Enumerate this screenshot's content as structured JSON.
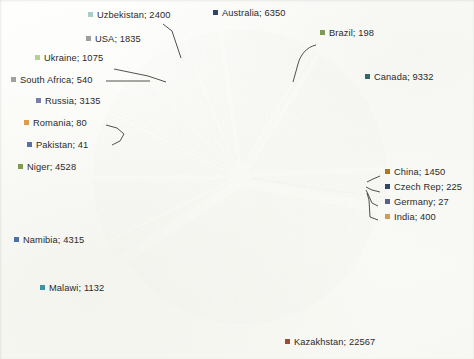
{
  "chart_data": {
    "type": "pie",
    "title": "",
    "subtitle": "",
    "xlabel": "",
    "ylabel": "",
    "legend_position": "callout-labels",
    "label_format": "name; value",
    "exploded": true,
    "grid": false,
    "total": 59655,
    "categories": [
      "Australia",
      "Brazil",
      "Canada",
      "China",
      "Czech Rep",
      "Germany",
      "India",
      "Kazakhstan",
      "Malawi",
      "Namibia",
      "Niger",
      "Pakistan",
      "Romania",
      "Russia",
      "South Africa",
      "Ukraine",
      "USA",
      "Uzbekistan"
    ],
    "values": [
      6350,
      198,
      9332,
      1450,
      225,
      27,
      400,
      22567,
      1132,
      4315,
      4528,
      41,
      80,
      3135,
      540,
      1075,
      1835,
      2400
    ],
    "colors": [
      "#2E4769",
      "#7F9B4E",
      "#33686B",
      "#A97B1E",
      "#2E4769",
      "#5B5F8C",
      "#D39B4B",
      "#9C4C37",
      "#3E93A3",
      "#4F6FA8",
      "#7F9B4E",
      "#5B6FA8",
      "#E09A4E",
      "#7B7FA8",
      "#9EA2A4",
      "#B9CE96",
      "#9E9E9E",
      "#A8CFCB"
    ],
    "slices": [
      {
        "name": "Australia",
        "value": 6350,
        "label": "Australia; 6350",
        "color": "#2E4769"
      },
      {
        "name": "Brazil",
        "value": 198,
        "label": "Brazil; 198",
        "color": "#7F9B4E"
      },
      {
        "name": "Canada",
        "value": 9332,
        "label": "Canada; 9332",
        "color": "#33686B"
      },
      {
        "name": "China",
        "value": 1450,
        "label": "China; 1450",
        "color": "#A97B1E"
      },
      {
        "name": "Czech Rep",
        "value": 225,
        "label": "Czech Rep; 225",
        "color": "#2E4769"
      },
      {
        "name": "Germany",
        "value": 27,
        "label": "Germany; 27",
        "color": "#5B5F8C"
      },
      {
        "name": "India",
        "value": 400,
        "label": "India; 400",
        "color": "#D39B4B"
      },
      {
        "name": "Kazakhstan",
        "value": 22567,
        "label": "Kazakhstan; 22567",
        "color": "#9C4C37"
      },
      {
        "name": "Malawi",
        "value": 1132,
        "label": "Malawi; 1132",
        "color": "#3E93A3"
      },
      {
        "name": "Namibia",
        "value": 4315,
        "label": "Namibia; 4315",
        "color": "#4F6FA8"
      },
      {
        "name": "Niger",
        "value": 4528,
        "label": "Niger; 4528",
        "color": "#7F9B4E"
      },
      {
        "name": "Pakistan",
        "value": 41,
        "label": "Pakistan; 41",
        "color": "#5B6FA8"
      },
      {
        "name": "Romania",
        "value": 80,
        "label": "Romania; 80",
        "color": "#E09A4E"
      },
      {
        "name": "Russia",
        "value": 3135,
        "label": "Russia; 3135",
        "color": "#7B7FA8"
      },
      {
        "name": "South Africa",
        "value": 540,
        "label": "South Africa; 540",
        "color": "#9EA2A4"
      },
      {
        "name": "Ukraine",
        "value": 1075,
        "label": "Ukraine; 1075",
        "color": "#B9CE96"
      },
      {
        "name": "USA",
        "value": 1835,
        "label": "USA; 1835",
        "color": "#9E9E9E"
      },
      {
        "name": "Uzbekistan",
        "value": 2400,
        "label": "Uzbekistan; 2400",
        "color": "#A8CFCB"
      }
    ]
  },
  "labels": {
    "uzbekistan": "Uzbekistan; 2400",
    "australia": "Australia; 6350",
    "brazil": "Brazil; 198",
    "usa": "USA; 1835",
    "canada": "Canada; 9332",
    "ukraine": "Ukraine; 1075",
    "south_africa": "South Africa; 540",
    "russia": "Russia; 3135",
    "romania": "Romania; 80",
    "pakistan": "Pakistan; 41",
    "niger": "Niger; 4528",
    "china": "China; 1450",
    "czech_rep": "Czech Rep; 225",
    "germany": "Germany; 27",
    "india": "India; 400",
    "namibia": "Namibia; 4315",
    "malawi": "Malawi; 1132",
    "kazakhstan": "Kazakhstan; 22567"
  }
}
